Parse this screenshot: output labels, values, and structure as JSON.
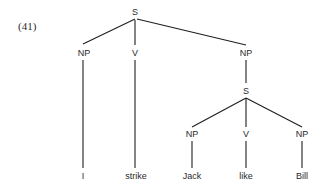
{
  "example_number": "(41)",
  "tree": {
    "root": "S",
    "nodes": {
      "s_root": "S",
      "np_subject": "NP",
      "v_main": "V",
      "np_object": "NP",
      "s_embedded": "S",
      "np_embedded_subject": "NP",
      "v_embedded": "V",
      "np_embedded_object": "NP"
    },
    "leaves": {
      "i": "I",
      "strike": "strike",
      "jack": "Jack",
      "like": "like",
      "bill": "Bill"
    },
    "bracketing": "[S [NP I] [V strike] [NP [S [NP Jack] [V like] [NP Bill]]]]"
  }
}
